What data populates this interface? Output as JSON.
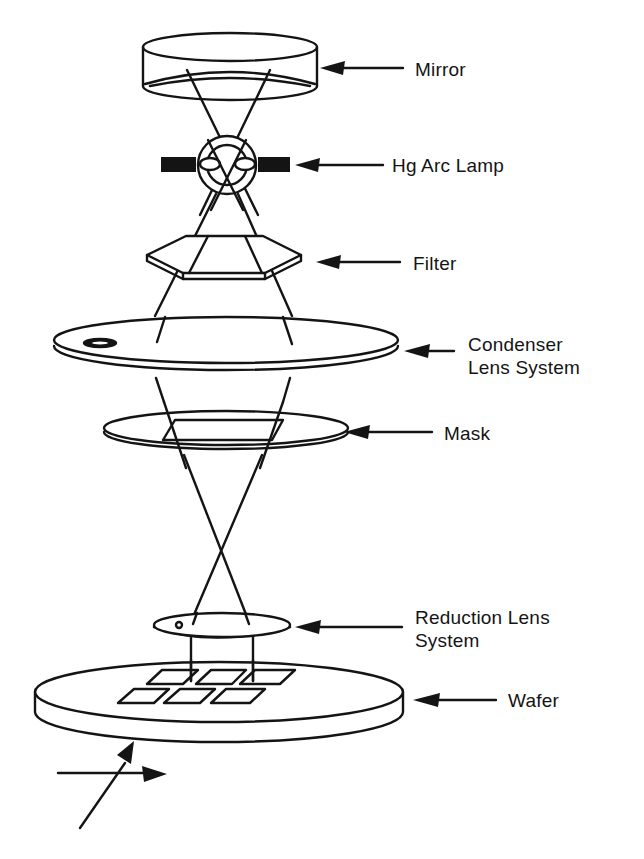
{
  "diagram": {
    "components": [
      {
        "id": "mirror",
        "label": "Mirror"
      },
      {
        "id": "lamp",
        "label": "Hg Arc Lamp"
      },
      {
        "id": "filter",
        "label": "Filter"
      },
      {
        "id": "condenser",
        "label_line1": "Condenser",
        "label_line2": "Lens System"
      },
      {
        "id": "mask",
        "label": "Mask"
      },
      {
        "id": "reduction",
        "label_line1": "Reduction Lens",
        "label_line2": "System"
      },
      {
        "id": "wafer",
        "label": "Wafer"
      }
    ],
    "wafer_dies": 6,
    "stage_axes_icon": "xy-stage-arrows",
    "colors": {
      "ink": "#141414",
      "background": "#ffffff"
    }
  }
}
